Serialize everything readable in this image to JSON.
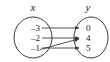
{
  "figure": {
    "type": "mapping-diagram",
    "stroke_color": "#3a3a3a",
    "text_color": "#1a1a1a",
    "background_color": "#ffffff"
  },
  "headers": {
    "domain": "x",
    "range": "y"
  },
  "domain_set": {
    "name": "x",
    "elements": [
      {
        "label": "–3",
        "value": -3
      },
      {
        "label": "–2",
        "value": -2
      },
      {
        "label": "–1",
        "value": -1
      }
    ]
  },
  "range_set": {
    "name": "y",
    "elements": [
      {
        "label": "0",
        "value": 0
      },
      {
        "label": "4",
        "value": 4
      },
      {
        "label": "5",
        "value": 5
      }
    ]
  },
  "mappings": [
    {
      "from": "–3",
      "to": "0"
    },
    {
      "from": "–2",
      "to": "4"
    },
    {
      "from": "–1",
      "to": "5"
    },
    {
      "from": "–1",
      "to": "4"
    }
  ]
}
